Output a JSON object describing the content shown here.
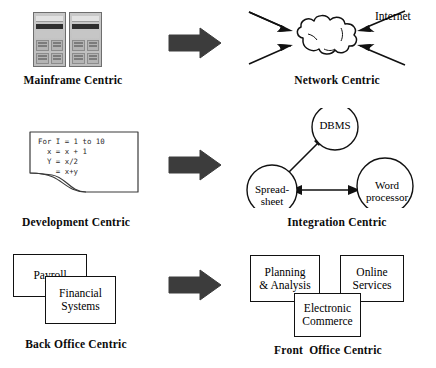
{
  "figure": {
    "background_color": "#ffffff",
    "arrow_color": "#3a3a3a",
    "line_color": "#111111"
  },
  "rows": [
    {
      "id": "row-1",
      "left_caption": "Mainframe Centric",
      "right_caption": "Network Centric",
      "arrow_icon": "right-block-arrow-icon"
    },
    {
      "id": "row-2",
      "left_caption": "Development Centric",
      "right_caption": "Integration Centric",
      "arrow_icon": "right-block-arrow-icon"
    },
    {
      "id": "row-3",
      "left_caption": "Back Office Centric",
      "right_caption": "Front  Office Centric",
      "arrow_icon": "right-block-arrow-icon"
    }
  ],
  "mainframe": {
    "icon": "mainframe-cabinets-icon",
    "cabinet_count": 2
  },
  "network": {
    "cloud_icon": "cloud-icon",
    "internet_label": "Internet",
    "bolt_count": 4
  },
  "development": {
    "paper_icon": "torn-paper-icon",
    "code_lines": [
      "For I = 1 to 10",
      "  x = x + 1",
      "  Y = x/2",
      "    = x+y"
    ]
  },
  "integration": {
    "nodes": [
      {
        "id": "dbms",
        "label": "DBMS"
      },
      {
        "id": "spreadsheet",
        "label": "Spread-\nsheet"
      },
      {
        "id": "word-processor",
        "label": "Word\nprocessor"
      }
    ],
    "connections": [
      {
        "from": "spreadsheet",
        "to": "dbms",
        "style": "double-arrow"
      },
      {
        "from": "spreadsheet",
        "to": "word-processor",
        "style": "double-arrow"
      }
    ]
  },
  "back_office": {
    "boxes": [
      {
        "id": "payroll",
        "label": "Payroll"
      },
      {
        "id": "financial-systems",
        "label": "Financial\nSystems"
      }
    ]
  },
  "front_office": {
    "boxes": [
      {
        "id": "planning-analysis",
        "label": "Planning\n& Analysis"
      },
      {
        "id": "online-services",
        "label": "Online\nServices"
      },
      {
        "id": "electronic-commerce",
        "label": "Electronic\nCommerce"
      }
    ]
  }
}
